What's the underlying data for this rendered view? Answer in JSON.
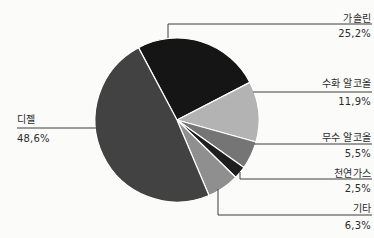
{
  "chart_data": {
    "type": "pie",
    "title": "",
    "legend_position": "none",
    "start_angle_deg": -28,
    "categories": [
      "가솔린",
      "수화 알코올",
      "무수 알코올",
      "천연가스",
      "기타",
      "디젤"
    ],
    "values": [
      25.2,
      11.9,
      5.5,
      2.5,
      6.3,
      48.6
    ],
    "value_labels": [
      "25,2%",
      "11,9%",
      "5,5%",
      "2,5%",
      "6,3%",
      "48,6%"
    ],
    "colors": [
      "#151515",
      "#b3b3b3",
      "#757575",
      "#1e1e1e",
      "#8f8f8f",
      "#424242"
    ],
    "separator_color": "#ffffff",
    "leader_line_color": "#3d3d3d",
    "label_color": "#2b2b2b",
    "background_color": "#fbfbfa"
  }
}
